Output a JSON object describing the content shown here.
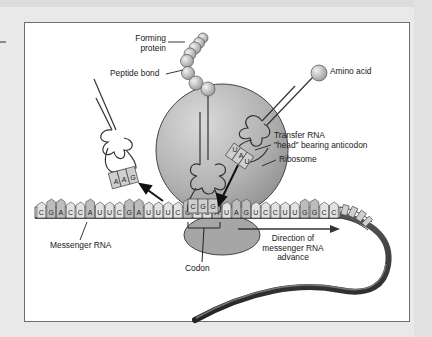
{
  "diagram": {
    "labels": {
      "forming_protein_1": "Forming",
      "forming_protein_2": "protein",
      "peptide_bond": "Peptide bond",
      "amino_acid": "Amino acid",
      "transfer_rna_1": "Transfer RNA",
      "transfer_rna_2": "\"head\" bearing anticodon",
      "ribosome": "Ribosome",
      "messenger_rna": "Messenger RNA",
      "codon": "Codon",
      "direction_1": "Direction of",
      "direction_2": "messenger RNA",
      "direction_3": "advance"
    },
    "mrna_sequence": [
      "C",
      "G",
      "A",
      "C",
      "C",
      "A",
      "U",
      "U",
      "C",
      "G",
      "A",
      "U",
      "U",
      "U",
      "C",
      "G",
      "C",
      "C",
      "A",
      "U",
      "A",
      "G",
      "U",
      "C",
      "C",
      "U",
      "U",
      "G",
      "G",
      "C",
      "C"
    ],
    "trna_left_anticodon": [
      "A",
      "A",
      "G"
    ],
    "trna_center_anticodon": [
      "C",
      "G",
      "G"
    ],
    "trna_right_anticodon": [
      "U",
      "A",
      "U"
    ],
    "colors": {
      "background": "#e9e9e9",
      "panel": "#ffffff",
      "ribosome": "#a9a9a9",
      "line": "#333333",
      "base_fill": "#c8c8c8"
    }
  }
}
